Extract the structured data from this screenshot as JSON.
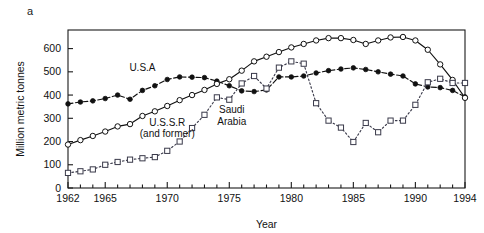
{
  "figure": {
    "panel_label": "a"
  },
  "chart_data": {
    "type": "line",
    "title": "",
    "xlabel": "Year",
    "ylabel": "Million metric tonnes",
    "xlim": [
      1962,
      1994
    ],
    "ylim": [
      0,
      680
    ],
    "yticks": [
      0,
      100,
      200,
      300,
      400,
      500,
      600
    ],
    "ytick_labels": [
      "0",
      "100",
      "200",
      "300",
      "400",
      "500",
      "600"
    ],
    "xticks": [
      1962,
      1965,
      1970,
      1975,
      1980,
      1985,
      1990,
      1994
    ],
    "xtick_labels": [
      "1962",
      "1965",
      "1970",
      "1975",
      "1980",
      "1985",
      "1990",
      "1994"
    ],
    "minor_xticks_every": 1,
    "grid": false,
    "legend_position": "inline-annotations",
    "x": [
      1962,
      1963,
      1964,
      1965,
      1966,
      1967,
      1968,
      1969,
      1970,
      1971,
      1972,
      1973,
      1974,
      1975,
      1976,
      1977,
      1978,
      1979,
      1980,
      1981,
      1982,
      1983,
      1984,
      1985,
      1986,
      1987,
      1988,
      1989,
      1990,
      1991,
      1992,
      1993,
      1994
    ],
    "series": [
      {
        "name": "U.S.A",
        "marker": "filled-circle",
        "line_style": "dashed",
        "color": "#111111",
        "label_x": 1968.0,
        "label_y": 505,
        "values": [
          362,
          370,
          375,
          385,
          400,
          382,
          420,
          440,
          467,
          478,
          477,
          475,
          460,
          440,
          418,
          415,
          422,
          478,
          478,
          482,
          495,
          505,
          512,
          517,
          510,
          500,
          490,
          482,
          448,
          435,
          432,
          420,
          392
        ]
      },
      {
        "name": "U.S.S.R (and former)",
        "marker": "open-circle",
        "line_style": "solid",
        "color": "#111111",
        "label_line1": "U.S.S.R",
        "label_line2": "(and former)",
        "label_x": 1970.0,
        "label_y": 268,
        "values": [
          187,
          206,
          224,
          243,
          265,
          275,
          310,
          330,
          353,
          378,
          400,
          422,
          448,
          468,
          505,
          545,
          565,
          585,
          605,
          620,
          635,
          645,
          645,
          637,
          620,
          635,
          648,
          650,
          635,
          595,
          532,
          465,
          388
        ]
      },
      {
        "name": "Saudi Arabia",
        "marker": "open-square",
        "line_style": "dotted",
        "color": "#3a3a4a",
        "label_line1": "Saudi",
        "label_line2": "Arabia",
        "label_x": 1975.2,
        "label_y": 322,
        "values": [
          65,
          72,
          80,
          100,
          112,
          122,
          128,
          133,
          160,
          200,
          258,
          315,
          390,
          380,
          450,
          482,
          428,
          518,
          545,
          535,
          365,
          290,
          260,
          198,
          280,
          240,
          290,
          290,
          358,
          455,
          470,
          452,
          452
        ]
      }
    ]
  }
}
